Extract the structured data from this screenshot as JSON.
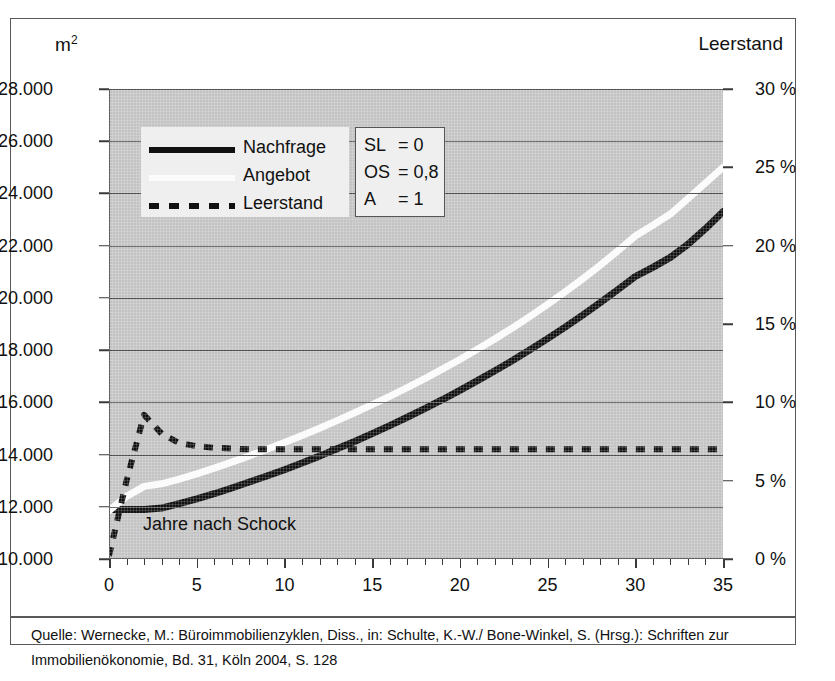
{
  "figure": {
    "left_axis_unit": "m",
    "left_axis_unit_sup": "2",
    "right_axis_title": "Leerstand",
    "annotation": "Jahre nach Schock",
    "caption": "Quelle: Wernecke, M.: Büroimmobilienzyklen, Diss., in: Schulte, K.-W./ Bone-Winkel, S. (Hrsg.): Schriften zur Immobilienökonomie, Bd. 31, Köln 2004, S. 128"
  },
  "legend": {
    "items": [
      {
        "label": "Nachfrage",
        "style": "solid-black",
        "color": "#111111"
      },
      {
        "label": "Angebot",
        "style": "solid-white",
        "color": "#fbfbfb"
      },
      {
        "label": "Leerstand",
        "style": "dashed-black",
        "color": "#111111"
      }
    ]
  },
  "parameters": [
    {
      "key": "SL",
      "value": "= 0"
    },
    {
      "key": "OS",
      "value": "= 0,8"
    },
    {
      "key": "A",
      "value": "= 1"
    }
  ],
  "colors": {
    "plot_background": "#c3c3c3",
    "gridline": "#4a4a4a",
    "frame": "#595959",
    "legend_background": "#efefef",
    "demand_line": "#111111",
    "supply_line": "#fbfbfb",
    "vacancy_line": "#111111"
  },
  "chart_data": {
    "type": "line",
    "title": "",
    "subtitle": "",
    "xlabel": "Jahre nach Schock",
    "ylabel": "m²",
    "y2label": "Leerstand",
    "xlim": [
      0,
      35
    ],
    "ylim": [
      10000,
      28000
    ],
    "y2lim": [
      0,
      30
    ],
    "grid": true,
    "legend_position": "top-left",
    "xticks": [
      0,
      5,
      10,
      15,
      20,
      25,
      30,
      35
    ],
    "xtick_labels": [
      "0",
      "5",
      "10",
      "15",
      "20",
      "25",
      "30",
      "35"
    ],
    "xtick_minor_step": 1,
    "yticks": [
      10000,
      12000,
      14000,
      16000,
      18000,
      20000,
      22000,
      24000,
      26000,
      28000
    ],
    "ytick_labels": [
      "10.000",
      "12.000",
      "14.000",
      "16.000",
      "18.000",
      "20.000",
      "22.000",
      "24.000",
      "26.000",
      "28.000"
    ],
    "y2ticks": [
      0,
      5,
      10,
      15,
      20,
      25,
      30
    ],
    "y2tick_labels": [
      "0 %",
      "5 %",
      "10 %",
      "15 %",
      "20 %",
      "25 %",
      "30 %"
    ],
    "x": [
      0,
      1,
      2,
      3,
      4,
      5,
      6,
      7,
      8,
      9,
      10,
      11,
      12,
      13,
      14,
      15,
      16,
      17,
      18,
      19,
      20,
      21,
      22,
      23,
      24,
      25,
      26,
      27,
      28,
      29,
      30,
      31,
      32,
      33,
      34,
      35
    ],
    "series": [
      {
        "name": "Nachfrage",
        "axis": "left",
        "style": "solid",
        "color": "#111111",
        "values": [
          11900,
          11900,
          11900,
          11950,
          12120,
          12300,
          12500,
          12720,
          12950,
          13180,
          13420,
          13680,
          13940,
          14220,
          14500,
          14800,
          15110,
          15430,
          15760,
          16100,
          16460,
          16830,
          17210,
          17600,
          18010,
          18440,
          18880,
          19340,
          19820,
          20310,
          20820,
          21170,
          21550,
          22050,
          22650,
          23300
        ]
      },
      {
        "name": "Angebot",
        "axis": "left",
        "style": "solid",
        "color": "#fbfbfb",
        "values": [
          11850,
          12400,
          12780,
          12880,
          13060,
          13260,
          13480,
          13710,
          13950,
          14200,
          14460,
          14730,
          15010,
          15300,
          15600,
          15910,
          16230,
          16560,
          16910,
          17270,
          17640,
          18030,
          18430,
          18850,
          19290,
          19750,
          20230,
          20730,
          21250,
          21800,
          22370,
          22780,
          23210,
          23800,
          24400,
          25000
        ]
      },
      {
        "name": "Leerstand",
        "axis": "right",
        "style": "dashed",
        "color": "#111111",
        "values": [
          0.2,
          5.0,
          9.2,
          8.0,
          7.4,
          7.2,
          7.1,
          7.05,
          7.0,
          7.0,
          7.0,
          7.0,
          7.0,
          7.0,
          7.0,
          7.0,
          7.0,
          7.0,
          7.0,
          7.0,
          7.0,
          7.0,
          7.0,
          7.0,
          7.0,
          7.0,
          7.0,
          7.0,
          7.0,
          7.0,
          7.0,
          7.0,
          7.0,
          7.0,
          7.0,
          7.0
        ]
      }
    ],
    "annotations": [
      {
        "text": "Jahre nach Schock",
        "x": 2,
        "y": 11100
      }
    ],
    "parameter_box": {
      "SL": "0",
      "OS": "0,8",
      "A": "1"
    }
  }
}
